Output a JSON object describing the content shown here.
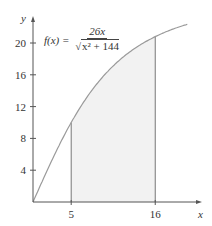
{
  "chart_data": {
    "type": "area",
    "title": "",
    "function": "f(x) = 26x / sqrt(x^2 + 144)",
    "formula": {
      "lhs": "f(x) =",
      "numerator": "26x",
      "denominator_radical": "√",
      "denominator_radicand": "x² + 144"
    },
    "xlabel": "x",
    "ylabel": "y",
    "x_ticks": [
      5,
      16
    ],
    "y_ticks": [
      4,
      8,
      12,
      16,
      20
    ],
    "xlim": [
      0,
      22
    ],
    "ylim": [
      0,
      23
    ],
    "shaded_region": {
      "from": 5,
      "to": 16
    },
    "curve_points": [
      {
        "x": 0,
        "y": 0
      },
      {
        "x": 2,
        "y": 4.27
      },
      {
        "x": 4,
        "y": 8.22
      },
      {
        "x": 5,
        "y": 10.0
      },
      {
        "x": 6,
        "y": 11.63
      },
      {
        "x": 8,
        "y": 14.42
      },
      {
        "x": 10,
        "y": 16.64
      },
      {
        "x": 12,
        "y": 18.38
      },
      {
        "x": 14,
        "y": 19.74
      },
      {
        "x": 16,
        "y": 20.8
      },
      {
        "x": 18,
        "y": 21.63
      },
      {
        "x": 20,
        "y": 22.29
      }
    ],
    "grid": false,
    "legend": null
  },
  "colors": {
    "axis": "#555555",
    "curve": "#9a9a9a",
    "shade": "#f2f2f2",
    "text": "#333333"
  }
}
